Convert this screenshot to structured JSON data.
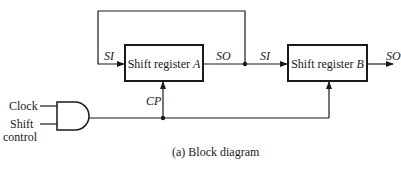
{
  "figure": {
    "caption": "(a) Block diagram"
  },
  "blocks": [
    {
      "id": "A",
      "label_prefix": "Shift register ",
      "label_suffix": "A"
    },
    {
      "id": "B",
      "label_prefix": "Shift register ",
      "label_suffix": "B"
    }
  ],
  "signals": {
    "si_a": "SI",
    "so_a": "SO",
    "si_b": "SI",
    "so_b": "SO",
    "cp": "CP"
  },
  "inputs": {
    "clock": "Clock",
    "shift_control_line1": "Shift",
    "shift_control_line2": "control"
  },
  "colors": {
    "line": "#1a1a1a",
    "background": "#ffffff"
  }
}
